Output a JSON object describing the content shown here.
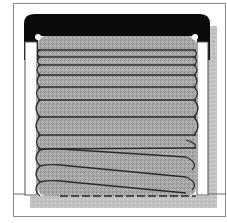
{
  "figure": {
    "colors": {
      "background": "#ffffff",
      "frame_line": "#7a7a7a",
      "lid": "#0a0a0a",
      "coil_fill": "#a9a9a9",
      "coil_outline": "#2a2a2a",
      "shadow": "#bdbdbd",
      "post": "#ffffff"
    },
    "coil_count": 12,
    "coils_upper": [
      {
        "y": 50
      },
      {
        "y": 62
      },
      {
        "y": 74
      },
      {
        "y": 86
      },
      {
        "y": 98
      },
      {
        "y": 110
      },
      {
        "y": 124
      },
      {
        "y": 140
      },
      {
        "y": 156
      }
    ],
    "coils_lower_tilted": [
      {
        "yl": 172,
        "yr": 180
      },
      {
        "yl": 186,
        "yr": 197
      },
      {
        "yl": 200,
        "yr": 212
      }
    ]
  }
}
